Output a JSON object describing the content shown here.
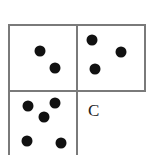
{
  "diagram": {
    "line_color": "#7a7a7a",
    "dot_color": "#111111",
    "cells": [
      {
        "id": "top-left",
        "dot_count": 2,
        "dots": [
          [
            40,
            51
          ],
          [
            55,
            68
          ]
        ]
      },
      {
        "id": "top-right",
        "dot_count": 3,
        "dots": [
          [
            92,
            40
          ],
          [
            121,
            52
          ],
          [
            95,
            69
          ]
        ]
      },
      {
        "id": "bottom-left",
        "dot_count": 5,
        "dots": [
          [
            28,
            106
          ],
          [
            55,
            103
          ],
          [
            44,
            117
          ],
          [
            27,
            141
          ],
          [
            61,
            143
          ]
        ]
      },
      {
        "id": "bottom-right",
        "label": "C"
      }
    ]
  }
}
